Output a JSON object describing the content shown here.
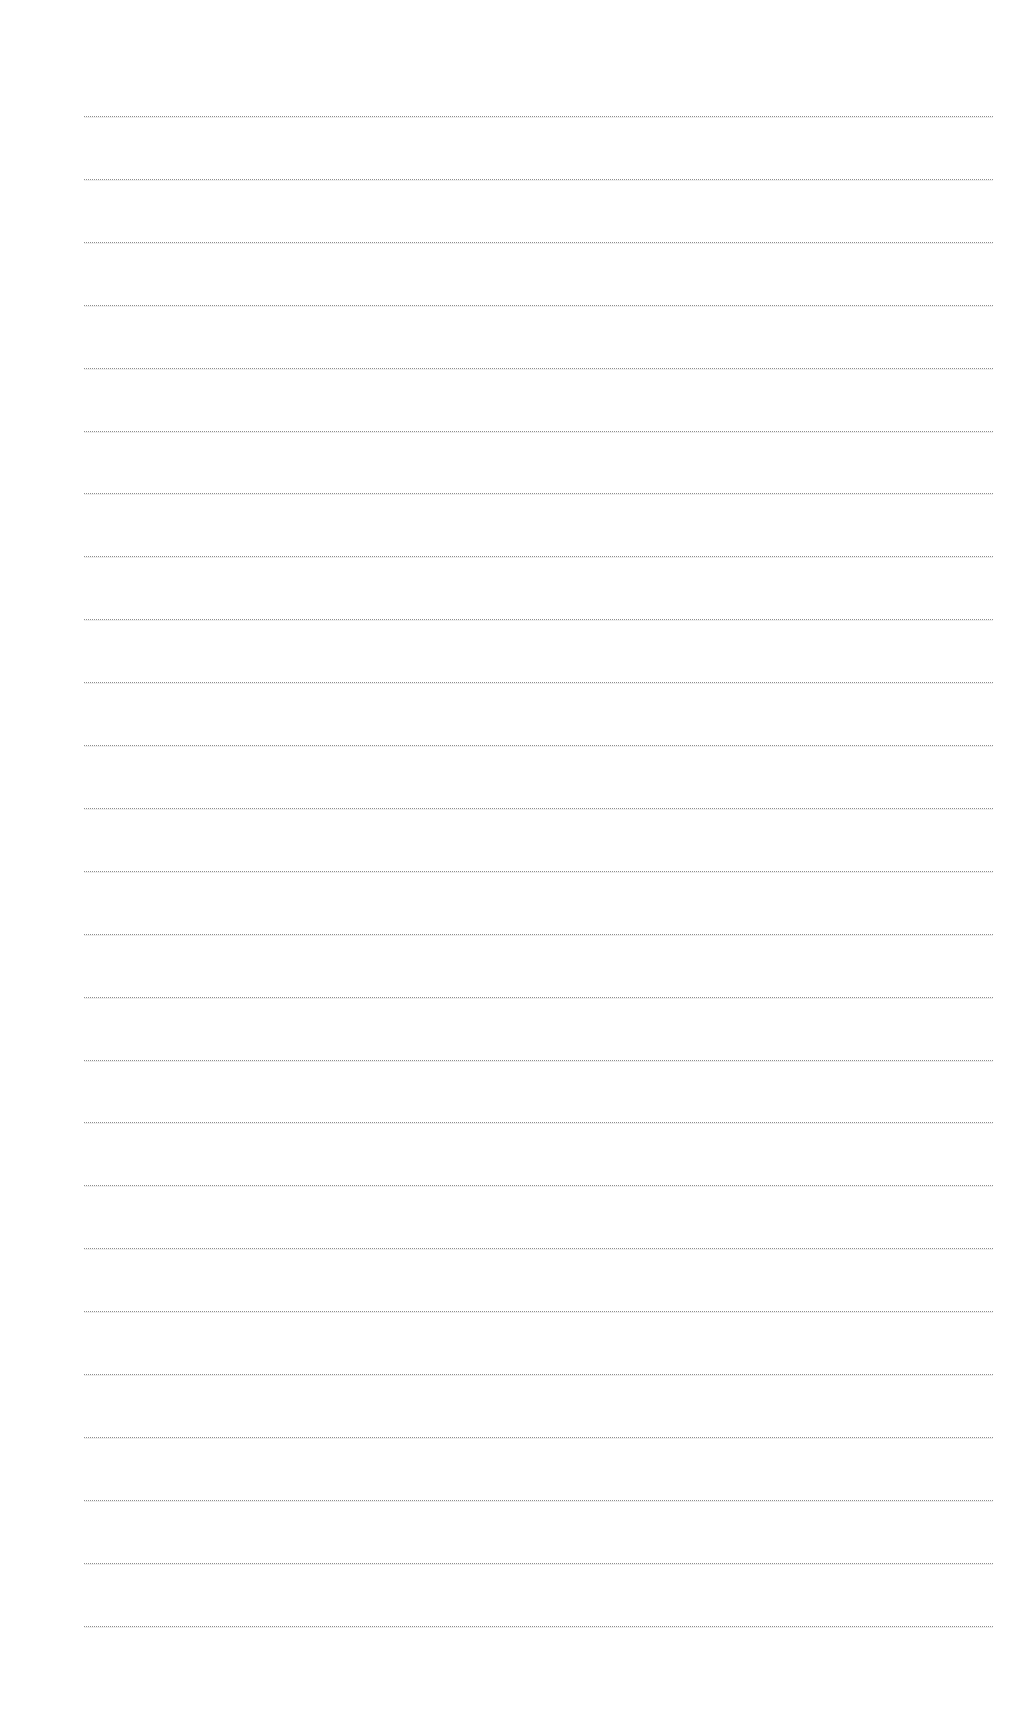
{
  "page": {
    "type": "blank-lined-sheet",
    "background_color": "#ffffff",
    "line_color": "#8e8e8e"
  },
  "ruling": {
    "line_count": 25,
    "first_line_y": 116,
    "line_spacing": 62.9,
    "left_x": 84,
    "right_x": 993
  },
  "lines": []
}
